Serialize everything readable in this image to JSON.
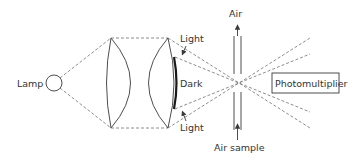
{
  "diagram": {
    "type": "optical-schematic",
    "labels": {
      "lamp": "Lamp",
      "light_top": "Light",
      "dark": "Dark",
      "light_bottom": "Light",
      "air_out": "Air",
      "air_in": "Air sample",
      "detector": "Photomultiplier"
    },
    "colors": {
      "line": "#3a3a3a",
      "dashed": "#707070",
      "background": "#ffffff"
    }
  }
}
